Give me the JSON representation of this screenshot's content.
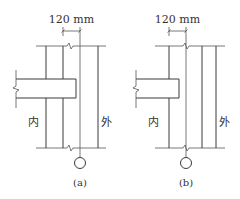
{
  "figures": [
    {
      "id": "a",
      "caption": "(a)",
      "dimension_label": "120 mm",
      "inner_label": "内",
      "outer_label": "外"
    },
    {
      "id": "b",
      "caption": "(b)",
      "dimension_label": "120 mm",
      "inner_label": "内",
      "outer_label": "外"
    }
  ]
}
